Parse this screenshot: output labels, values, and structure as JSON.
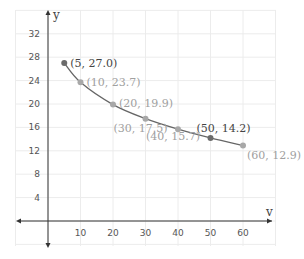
{
  "chart_data": {
    "type": "scatter",
    "title": "",
    "xlabel": "v",
    "ylabel": "y",
    "xlim": [
      -10,
      70
    ],
    "ylim": [
      -4,
      34
    ],
    "x_ticks": [
      10,
      20,
      30,
      40,
      50,
      60
    ],
    "y_ticks": [
      4,
      8,
      12,
      16,
      20,
      24,
      28,
      32
    ],
    "grid": true,
    "curve": "smooth decreasing curve through points",
    "points": [
      {
        "x": 5,
        "y": 27.0,
        "label": "(5, 27.0)",
        "emphasis": true
      },
      {
        "x": 10,
        "y": 23.7,
        "label": "(10, 23.7)",
        "emphasis": false
      },
      {
        "x": 20,
        "y": 19.9,
        "label": "(20, 19.9)",
        "emphasis": false
      },
      {
        "x": 30,
        "y": 17.5,
        "label": "(30, 17.5)",
        "emphasis": false
      },
      {
        "x": 40,
        "y": 15.7,
        "label": "(40, 15.7)",
        "emphasis": false
      },
      {
        "x": 50,
        "y": 14.2,
        "label": "(50, 14.2)",
        "emphasis": true
      },
      {
        "x": 60,
        "y": 12.9,
        "label": "(60, 12.9)",
        "emphasis": false
      }
    ]
  },
  "colors": {
    "grid": "#ececec",
    "axis": "#333333",
    "curve": "#666666",
    "point_emphasis": "#6b6b6b",
    "point_normal": "#a8a8a8",
    "label_emphasis": "#444444",
    "label_normal": "#a0a0a0"
  },
  "layout": {
    "x0_px": 48,
    "px_per_x": 3.25,
    "y0_px": 221,
    "px_per_y": 5.85,
    "label_offsets": [
      [
        6,
        4
      ],
      [
        6,
        4
      ],
      [
        6,
        2
      ],
      [
        -32,
        13
      ],
      [
        -32,
        11
      ],
      [
        -14,
        -6
      ],
      [
        4,
        13
      ]
    ]
  }
}
